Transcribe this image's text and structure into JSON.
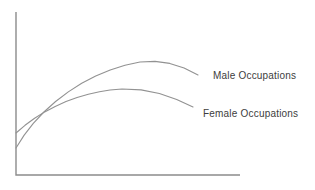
{
  "figure": {
    "background": "#ffffff",
    "axis_color": "#8c8c8c",
    "curve_color": "#929292",
    "label_color": "#3d3d3d"
  },
  "chart_data": {
    "type": "line",
    "title": "",
    "xlabel": "",
    "ylabel": "",
    "axis_ticks_shown": false,
    "legend_position": "inline-right-of-curves",
    "axes_px": {
      "origin": [
        16,
        175
      ],
      "y_axis_top": 12,
      "x_axis_right": 240
    },
    "series": [
      {
        "name": "Male Occupations",
        "shape": "rises steeply from low start, crosses other curve, peaks late, slight decline",
        "points_px": [
          [
            16,
            148
          ],
          [
            24,
            135.4
          ],
          [
            33.3,
            123.3
          ],
          [
            43.9,
            112
          ],
          [
            55.6,
            101.5
          ],
          [
            68.3,
            91.9
          ],
          [
            81.7,
            83.3
          ],
          [
            95.7,
            76
          ],
          [
            110.2,
            69.9
          ],
          [
            125,
            65.2
          ],
          [
            140,
            62
          ],
          [
            155,
            61.4
          ],
          [
            169.8,
            63.4
          ],
          [
            184.1,
            68
          ],
          [
            198,
            75
          ]
        ]
      },
      {
        "name": "Female Occupations",
        "shape": "starts higher, rises gently, peaks earlier and lower, declines",
        "points_px": [
          [
            16,
            133
          ],
          [
            25,
            125.3
          ],
          [
            34.6,
            118.2
          ],
          [
            44.7,
            111.9
          ],
          [
            55.2,
            106.4
          ],
          [
            66,
            101.6
          ],
          [
            77.1,
            97.5
          ],
          [
            88.3,
            94.3
          ],
          [
            99.5,
            91.8
          ],
          [
            110,
            90
          ],
          [
            122,
            89
          ],
          [
            141.1,
            89.9
          ],
          [
            159.4,
            93.5
          ],
          [
            176.7,
            99.4
          ],
          [
            193,
            107
          ]
        ]
      }
    ],
    "crossing_point_px": [
      45,
      111
    ],
    "labels": [
      {
        "text": "Male Occupations"
      },
      {
        "text": "Female Occupations"
      }
    ]
  }
}
